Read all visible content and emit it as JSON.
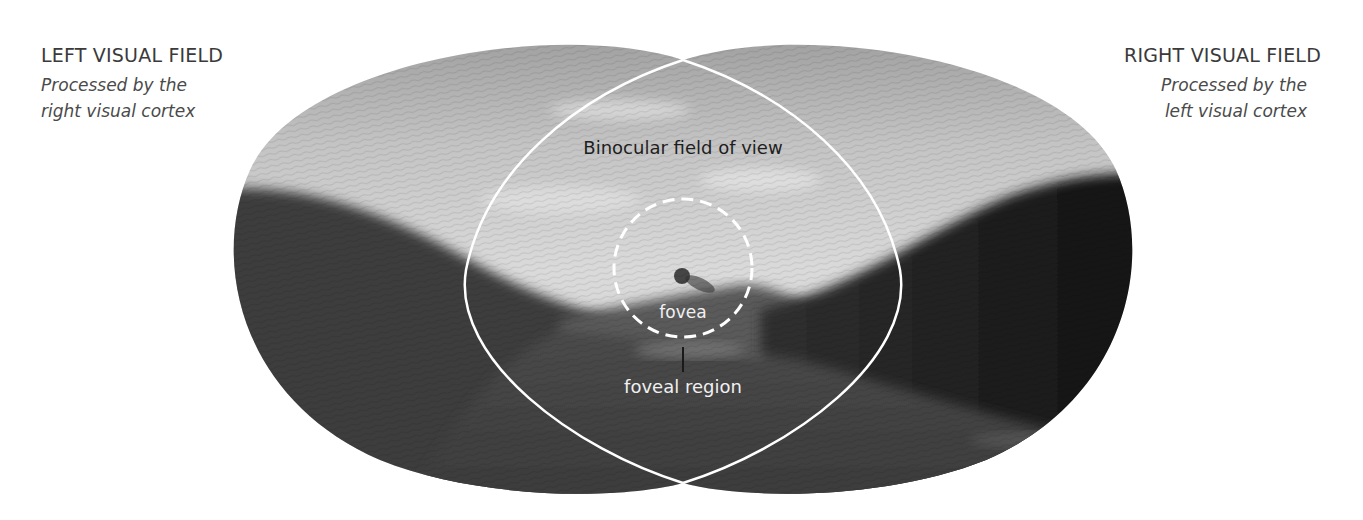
{
  "left_field": {
    "heading": "LEFT VISUAL FIELD",
    "sub_line1": "Processed by the",
    "sub_line2": "right visual cortex"
  },
  "right_field": {
    "heading": "RIGHT VISUAL FIELD",
    "sub_line1": "Processed by the",
    "sub_line2": "left visual cortex"
  },
  "diagram": {
    "binocular_label": "Binocular field of view",
    "fovea_label": "fovea",
    "foveal_region_label": "foveal region",
    "colors": {
      "outline": "#ffffff",
      "sky_light": "#d8d8d8",
      "hills_dark": "#2a2a2a",
      "text_dark": "#1e1e1e",
      "text_light": "#f2f2f2"
    }
  }
}
